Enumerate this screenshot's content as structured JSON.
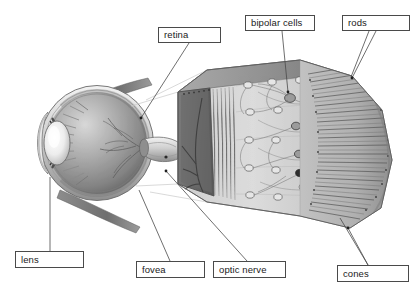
{
  "figure": {
    "kind": "anatomical-diagram",
    "background_color": "#ffffff",
    "line_color": "#4a4a4a",
    "text_color": "#1a1a1a",
    "partial_title_top": ""
  },
  "labels": [
    {
      "id": "retina",
      "text": "retina",
      "x": 158,
      "y": 27,
      "w": 63,
      "h": 16
    },
    {
      "id": "bipolar",
      "text": "bipolar cells",
      "x": 245,
      "y": 15,
      "w": 70,
      "h": 16
    },
    {
      "id": "rods",
      "text": "rods",
      "x": 342,
      "y": 15,
      "w": 68,
      "h": 16
    },
    {
      "id": "lens",
      "text": "lens",
      "x": 15,
      "y": 251,
      "w": 69,
      "h": 17
    },
    {
      "id": "fovea",
      "text": "fovea",
      "x": 136,
      "y": 261,
      "w": 69,
      "h": 17
    },
    {
      "id": "optic-nerve",
      "text": "optic nerve",
      "x": 213,
      "y": 261,
      "w": 73,
      "h": 17
    },
    {
      "id": "cones",
      "text": "cones",
      "x": 337,
      "y": 265,
      "w": 72,
      "h": 17
    }
  ],
  "leaders": [
    {
      "id": "retina-leader",
      "from_label": "retina",
      "points": "189,43 141,118"
    },
    {
      "id": "bipolar-leader",
      "from_label": "bipolar",
      "points": "282,31 288,92"
    },
    {
      "id": "rods-leader",
      "from_label": "rods",
      "points": "369,31 351,77"
    },
    {
      "id": "rods-leader-2",
      "from_label": "rods",
      "points": "376,31 352,78"
    },
    {
      "id": "lens-leader",
      "from_label": "lens",
      "points": "50,251 50,177"
    },
    {
      "id": "fovea-leader",
      "from_label": "fovea",
      "points": "170,261 139,190"
    },
    {
      "id": "optic-nerve-leader",
      "from_label": "optic-nerve",
      "points": "247,261 166,171"
    },
    {
      "id": "cones-leader",
      "from_label": "cones",
      "points": "368,265 348,228"
    },
    {
      "id": "cones-leader-2",
      "from_label": "cones",
      "points": "368,265 340,218"
    }
  ],
  "eye_parts": [
    {
      "id": "sclera",
      "name": "sclera"
    },
    {
      "id": "cornea",
      "name": "cornea"
    },
    {
      "id": "lens-body",
      "name": "lens"
    },
    {
      "id": "ciliary-body",
      "name": "ciliary body"
    },
    {
      "id": "iris",
      "name": "iris"
    },
    {
      "id": "vitreous",
      "name": "vitreous chamber"
    },
    {
      "id": "retina-layer",
      "name": "retina"
    },
    {
      "id": "optic-nerve-stalk",
      "name": "optic nerve"
    },
    {
      "id": "extraocular-muscle-upper",
      "name": "extraocular muscle"
    },
    {
      "id": "extraocular-muscle-lower",
      "name": "extraocular muscle"
    },
    {
      "id": "blood-vessels",
      "name": "retinal blood vessels"
    }
  ],
  "retina_block": {
    "id": "retina-magnified-block",
    "name": "magnified retina wedge",
    "layers": [
      {
        "id": "inner-surface",
        "name": "inner retinal surface with vessels"
      },
      {
        "id": "ganglion-layer",
        "name": "ganglion cell layer"
      },
      {
        "id": "bipolar-layer",
        "name": "bipolar cell layer"
      },
      {
        "id": "photoreceptor-layer",
        "name": "rod and cone photoreceptor layer"
      }
    ]
  },
  "palette": {
    "paper": "#ffffff",
    "ink": "#4a4a4a",
    "eye_mid": "#9a9a9a",
    "eye_dark": "#5e5e5e",
    "eye_light": "#e2e2e2",
    "block_face": "#6d6d6d",
    "block_tissue": "#c9c9c9",
    "vessel": "#4e4e4e"
  }
}
